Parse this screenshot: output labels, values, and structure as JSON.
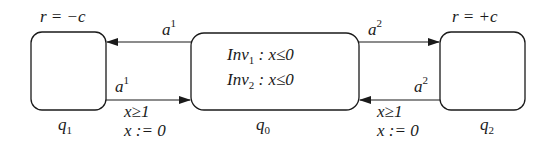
{
  "diagram": {
    "type": "automaton",
    "states": [
      {
        "id": "q1",
        "label": "q",
        "label_sub": "1",
        "annotation": "r = −c",
        "invariants": []
      },
      {
        "id": "q0",
        "label": "q",
        "label_sub": "0",
        "annotation": "",
        "invariants": [
          {
            "name": "Inv",
            "sub": "1",
            "text": " : x≤0"
          },
          {
            "name": "Inv",
            "sub": "2",
            "text": " : x≤0"
          }
        ]
      },
      {
        "id": "q2",
        "label": "q",
        "label_sub": "2",
        "annotation": "r = +c",
        "invariants": []
      }
    ],
    "transitions": [
      {
        "from": "q0",
        "to": "q1",
        "action": "a",
        "action_sup": "1",
        "guard": "",
        "reset": ""
      },
      {
        "from": "q1",
        "to": "q0",
        "action": "a",
        "action_sup": "1",
        "guard": "x≥1",
        "reset": "x := 0"
      },
      {
        "from": "q0",
        "to": "q2",
        "action": "a",
        "action_sup": "2",
        "guard": "",
        "reset": ""
      },
      {
        "from": "q2",
        "to": "q0",
        "action": "a",
        "action_sup": "2",
        "guard": "x≥1",
        "reset": "x := 0"
      }
    ]
  },
  "colors": {
    "stroke": "#1a1a1a",
    "background": "#ffffff"
  }
}
